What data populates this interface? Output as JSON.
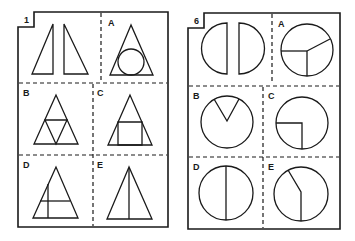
{
  "panels": [
    {
      "number": "1",
      "prompt": "two right triangles",
      "options": [
        {
          "label": "A",
          "description": "triangle with inscribed circle"
        },
        {
          "label": "B",
          "description": "triangle subdivided into four triangles"
        },
        {
          "label": "C",
          "description": "triangle with inscribed square"
        },
        {
          "label": "D",
          "description": "triangle with cross lines"
        },
        {
          "label": "E",
          "description": "triangle split by vertical line"
        }
      ]
    },
    {
      "number": "6",
      "prompt": "two half circles",
      "options": [
        {
          "label": "A",
          "description": "circle divided into three sectors"
        },
        {
          "label": "B",
          "description": "circle with wedge cut"
        },
        {
          "label": "C",
          "description": "circle with quarter square"
        },
        {
          "label": "D",
          "description": "circle split by vertical diameter"
        },
        {
          "label": "E",
          "description": "circle with bent line"
        }
      ]
    }
  ],
  "colors": {
    "ink": "#1a1a1a",
    "background": "#ffffff"
  }
}
